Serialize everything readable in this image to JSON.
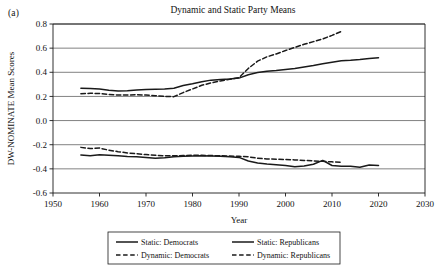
{
  "panel": {
    "label": "(a)"
  },
  "chart_data": {
    "type": "line",
    "title": "Dynamic and Static Party Means",
    "xlabel": "Year",
    "ylabel": "DW-NOMINATE Mean Scores",
    "xlim": [
      1950,
      2030
    ],
    "ylim": [
      -0.6,
      0.8
    ],
    "xticks": [
      1950,
      1960,
      1970,
      1980,
      1990,
      2000,
      2010,
      2020,
      2030
    ],
    "yticks": [
      0.8,
      0.6,
      0.4,
      0.2,
      0.0,
      -0.2,
      -0.4,
      -0.6
    ],
    "ytick_labels": [
      "0.8",
      "0.6",
      "0.4",
      "0.2",
      "0.0",
      "-0.2",
      "-0.4",
      "-0.6"
    ],
    "xtick_labels": [
      "1950",
      "1960",
      "1970",
      "1980",
      "1990",
      "2000",
      "2010",
      "2020",
      "2030"
    ],
    "grid": "horizontal",
    "legend_position": "bottom",
    "line_color": "#1a1a1a",
    "series": [
      {
        "name": "Static: Democrats",
        "style": "solid",
        "x": [
          1956,
          1958,
          1960,
          1962,
          1964,
          1966,
          1968,
          1970,
          1972,
          1974,
          1976,
          1978,
          1980,
          1982,
          1984,
          1986,
          1988,
          1990,
          1992,
          1994,
          1996,
          1998,
          2000,
          2002,
          2004,
          2006,
          2008,
          2010,
          2012,
          2014,
          2016,
          2018,
          2020
        ],
        "values": [
          -0.285,
          -0.292,
          -0.283,
          -0.288,
          -0.292,
          -0.297,
          -0.3,
          -0.305,
          -0.312,
          -0.308,
          -0.3,
          -0.296,
          -0.293,
          -0.292,
          -0.294,
          -0.296,
          -0.3,
          -0.305,
          -0.335,
          -0.352,
          -0.36,
          -0.366,
          -0.372,
          -0.382,
          -0.376,
          -0.362,
          -0.33,
          -0.372,
          -0.378,
          -0.378,
          -0.386,
          -0.368,
          -0.372
        ]
      },
      {
        "name": "Static: Republicans",
        "style": "solid",
        "x": [
          1956,
          1958,
          1960,
          1962,
          1964,
          1966,
          1968,
          1970,
          1972,
          1974,
          1976,
          1978,
          1980,
          1982,
          1984,
          1986,
          1988,
          1990,
          1992,
          1994,
          1996,
          1998,
          2000,
          2002,
          2004,
          2006,
          2008,
          2010,
          2012,
          2014,
          2016,
          2018,
          2020
        ],
        "values": [
          0.268,
          0.266,
          0.262,
          0.252,
          0.246,
          0.248,
          0.253,
          0.258,
          0.26,
          0.262,
          0.268,
          0.29,
          0.305,
          0.322,
          0.335,
          0.34,
          0.345,
          0.352,
          0.38,
          0.398,
          0.408,
          0.414,
          0.424,
          0.432,
          0.444,
          0.456,
          0.47,
          0.484,
          0.496,
          0.5,
          0.506,
          0.514,
          0.52
        ]
      },
      {
        "name": "Dynamic: Democrats",
        "style": "dashed",
        "x": [
          1956,
          1958,
          1960,
          1962,
          1964,
          1966,
          1968,
          1970,
          1972,
          1974,
          1976,
          1978,
          1980,
          1982,
          1984,
          1986,
          1988,
          1990,
          1992,
          1994,
          1996,
          1998,
          2000,
          2002,
          2004,
          2006,
          2008,
          2010,
          2012
        ],
        "values": [
          -0.222,
          -0.232,
          -0.228,
          -0.245,
          -0.258,
          -0.268,
          -0.275,
          -0.282,
          -0.288,
          -0.292,
          -0.292,
          -0.29,
          -0.288,
          -0.288,
          -0.29,
          -0.292,
          -0.294,
          -0.296,
          -0.3,
          -0.312,
          -0.318,
          -0.32,
          -0.322,
          -0.326,
          -0.33,
          -0.334,
          -0.338,
          -0.342,
          -0.346
        ]
      },
      {
        "name": "Dynamic: Republicans",
        "style": "dashed",
        "x": [
          1956,
          1958,
          1960,
          1962,
          1964,
          1966,
          1968,
          1970,
          1972,
          1974,
          1976,
          1978,
          1980,
          1982,
          1984,
          1986,
          1988,
          1990,
          1992,
          1994,
          1996,
          1998,
          2000,
          2002,
          2004,
          2006,
          2008,
          2010,
          2012
        ],
        "values": [
          0.222,
          0.226,
          0.224,
          0.216,
          0.212,
          0.212,
          0.214,
          0.212,
          0.206,
          0.2,
          0.198,
          0.232,
          0.262,
          0.292,
          0.312,
          0.328,
          0.342,
          0.356,
          0.432,
          0.492,
          0.528,
          0.552,
          0.58,
          0.606,
          0.632,
          0.654,
          0.676,
          0.706,
          0.738
        ]
      }
    ],
    "legend": [
      {
        "label": "Static: Democrats",
        "style": "solid"
      },
      {
        "label": "Static: Republicans",
        "style": "solid"
      },
      {
        "label": "Dynamic: Democrats",
        "style": "dashed"
      },
      {
        "label": "Dynamic: Republicans",
        "style": "dashed"
      }
    ]
  }
}
